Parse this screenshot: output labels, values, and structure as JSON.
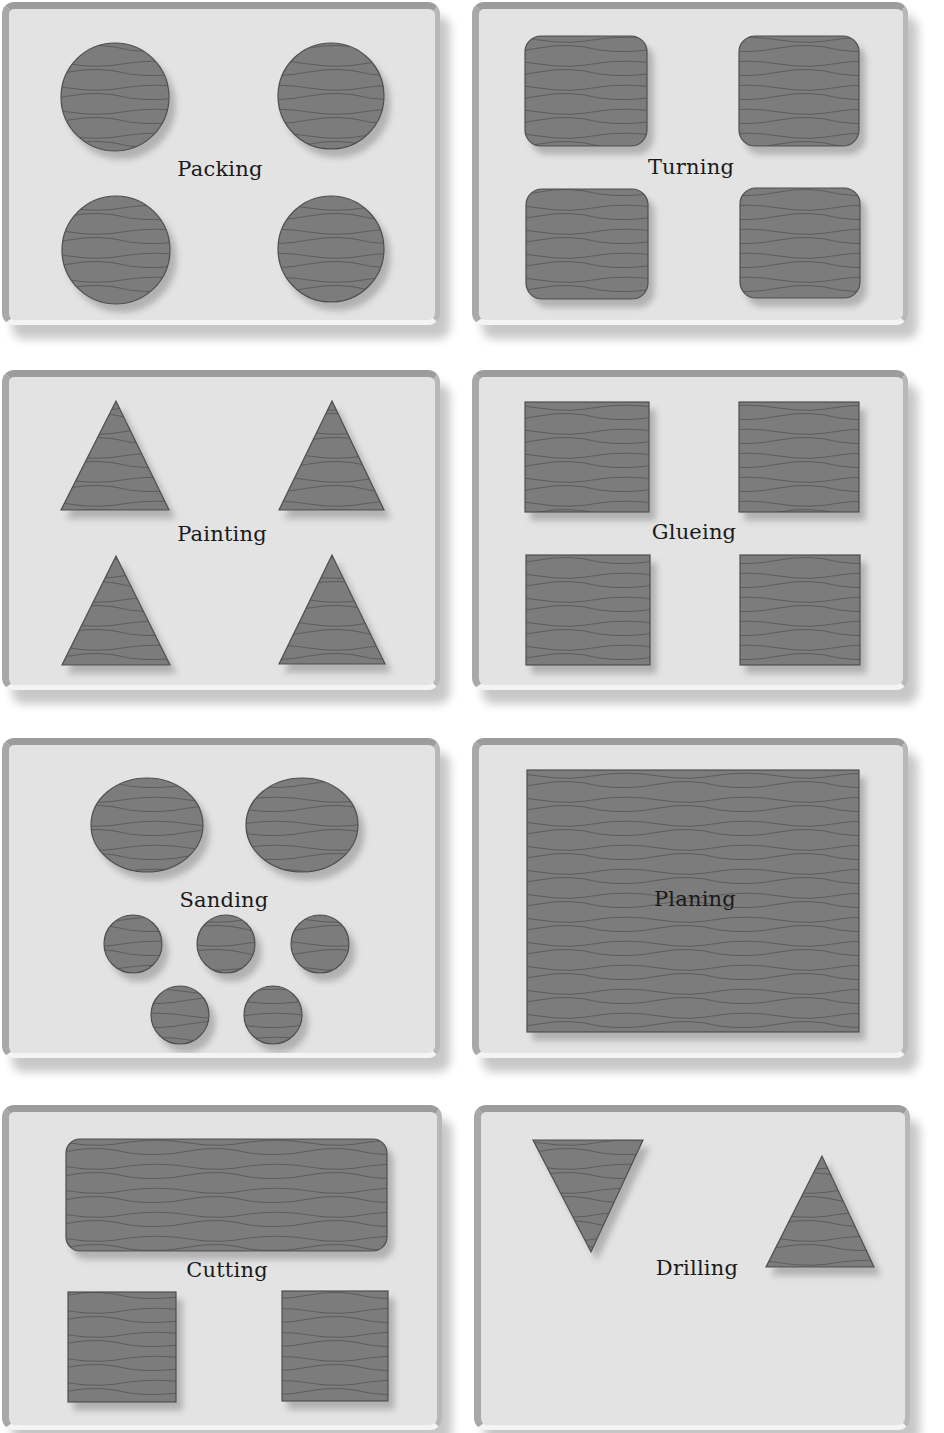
{
  "colors": {
    "panel_bg": "#e3e3e3",
    "panel_border": "#9a9a9a",
    "shape_fill": "#7a7a7a",
    "shape_stroke": "#4e4e4e",
    "grain": "#5f5f5f",
    "label": "#1a1a1a"
  },
  "panels": [
    {
      "label": "Packing",
      "shape": "circle",
      "count": 4,
      "layout": "2x2"
    },
    {
      "label": "Turning",
      "shape": "rounded-square",
      "count": 4,
      "layout": "2x2"
    },
    {
      "label": "Painting",
      "shape": "triangle",
      "count": 4,
      "layout": "2x2"
    },
    {
      "label": "Glueing",
      "shape": "square",
      "count": 4,
      "layout": "2x2"
    },
    {
      "label": "Sanding",
      "shape": "circle",
      "count": 7,
      "layout": "2 large + 3 small + 2 small"
    },
    {
      "label": "Planing",
      "shape": "rectangle",
      "count": 1,
      "layout": "single large"
    },
    {
      "label": "Cutting",
      "shape": "rectangle",
      "count": 3,
      "layout": "1 wide rounded + 2 small"
    },
    {
      "label": "Drilling",
      "shape": "triangle",
      "count": 3,
      "layout": "2 inverted + 1 upright"
    }
  ]
}
